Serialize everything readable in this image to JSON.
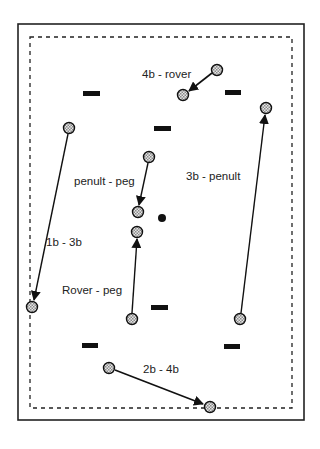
{
  "diagram": {
    "colors": {
      "outer_border": "#222222",
      "inner_boundary": "#222222",
      "ball_outline": "#111111",
      "ball_fill": "#bdbdbd",
      "hoop": "#111111",
      "peg": "#111111",
      "arrow": "#111111",
      "label": "#222222"
    },
    "court": {
      "outer": {
        "x": 18,
        "y": 24,
        "w": 286,
        "h": 396
      },
      "inner_dashed": {
        "x": 30,
        "y": 37,
        "w": 262,
        "h": 371
      }
    },
    "peg": {
      "cx": 162,
      "cy": 218,
      "r": 4
    },
    "hoops": [
      {
        "id": "hoop-1",
        "x": 83,
        "y": 91,
        "w": 17,
        "h": 5
      },
      {
        "id": "hoop-2",
        "x": 225,
        "y": 90,
        "w": 16,
        "h": 5
      },
      {
        "id": "hoop-3",
        "x": 154,
        "y": 126,
        "w": 17,
        "h": 5
      },
      {
        "id": "hoop-4",
        "x": 151,
        "y": 305,
        "w": 17,
        "h": 5
      },
      {
        "id": "hoop-5",
        "x": 82,
        "y": 343,
        "w": 16,
        "h": 5
      },
      {
        "id": "hoop-6",
        "x": 224,
        "y": 344,
        "w": 16,
        "h": 5
      }
    ],
    "moves": [
      {
        "label": "4b - rover",
        "from": [
          217,
          70
        ],
        "to": [
          183,
          95
        ],
        "label_pos": [
          142,
          78
        ]
      },
      {
        "label": "3b - penult",
        "from": [
          240,
          319
        ],
        "to": [
          266,
          108
        ],
        "label_pos": [
          186,
          180
        ]
      },
      {
        "label": "penult - peg",
        "from": [
          149,
          157
        ],
        "to": [
          138,
          212
        ],
        "label_pos": [
          74,
          185
        ]
      },
      {
        "label": "1b - 3b",
        "from": [
          69,
          128
        ],
        "to": [
          32,
          307
        ],
        "label_pos": [
          46,
          246
        ]
      },
      {
        "label": "Rover - peg",
        "from": [
          132,
          319
        ],
        "to": [
          137,
          232
        ],
        "label_pos": [
          62,
          294
        ]
      },
      {
        "label": "2b - 4b",
        "from": [
          109,
          368
        ],
        "to": [
          210,
          407
        ],
        "label_pos": [
          143,
          373
        ]
      }
    ]
  }
}
